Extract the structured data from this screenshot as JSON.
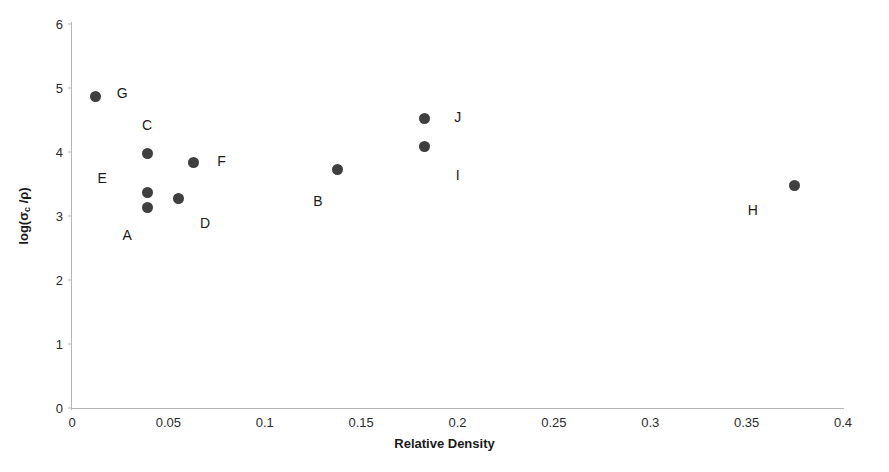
{
  "chart_data": {
    "type": "scatter",
    "title": "",
    "xlabel": "Relative Density",
    "ylabel": "log(σc /ρ)",
    "ylabel_base": "log(σ",
    "ylabel_sub": "c",
    "ylabel_tail": " /ρ)",
    "xlim": [
      0,
      0.4
    ],
    "ylim": [
      0,
      6
    ],
    "grid": false,
    "legend": "none",
    "marker_color": "#3f3f3f",
    "axis_color": "#b4b4b4",
    "xticks": [
      "0",
      "0.05",
      "0.1",
      "0.15",
      "0.2",
      "0.25",
      "0.3",
      "0.35",
      "0.4"
    ],
    "xtick_values": [
      0,
      0.05,
      0.1,
      0.15,
      0.2,
      0.25,
      0.3,
      0.35,
      0.4
    ],
    "yticks": [
      "0",
      "1",
      "2",
      "3",
      "4",
      "5",
      "6"
    ],
    "ytick_values": [
      0,
      1,
      2,
      3,
      4,
      5,
      6
    ],
    "points": [
      {
        "label": "G",
        "x": 0.012,
        "y": 4.86,
        "label_dx": 27,
        "label_dy": -4
      },
      {
        "label": "C",
        "x": 0.039,
        "y": 3.98,
        "label_dx": 0,
        "label_dy": -28
      },
      {
        "label": "E",
        "x": 0.039,
        "y": 3.36,
        "label_dx": -45,
        "label_dy": -15
      },
      {
        "label": "A",
        "x": 0.039,
        "y": 3.14,
        "label_dx": -20,
        "label_dy": 28
      },
      {
        "label": "D",
        "x": 0.055,
        "y": 3.28,
        "label_dx": 27,
        "label_dy": 25
      },
      {
        "label": "F",
        "x": 0.063,
        "y": 3.83,
        "label_dx": 28,
        "label_dy": -2
      },
      {
        "label": "B",
        "x": 0.138,
        "y": 3.73,
        "label_dx": -20,
        "label_dy": 32
      },
      {
        "label": "J",
        "x": 0.183,
        "y": 4.53,
        "label_dx": 33,
        "label_dy": -1
      },
      {
        "label": "I",
        "x": 0.183,
        "y": 4.08,
        "label_dx": 33,
        "label_dy": 28
      },
      {
        "label": "H",
        "x": 0.375,
        "y": 3.47,
        "label_dx": -42,
        "label_dy": 24
      }
    ]
  }
}
